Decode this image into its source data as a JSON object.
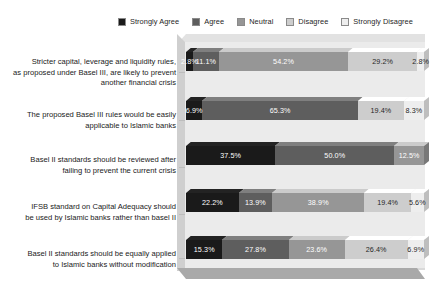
{
  "legend": {
    "position": "top-center",
    "items": [
      {
        "label": "Strongly Agree",
        "color": "#1a1a1a"
      },
      {
        "label": "Agree",
        "color": "#5e5e5e"
      },
      {
        "label": "Neutral",
        "color": "#969696"
      },
      {
        "label": "Disagree",
        "color": "#cdcdcd"
      },
      {
        "label": "Strongly Disagree",
        "color": "#eeeeee"
      }
    ]
  },
  "chart_data": {
    "type": "bar",
    "orientation": "horizontal",
    "stacked": true,
    "stack_mode": "percent",
    "title": "",
    "xlabel": "",
    "ylabel": "",
    "xlim": [
      0,
      100
    ],
    "grid": false,
    "legend_position": "top-center",
    "categories": [
      "Stricter capital, leverage and liquidity rules, as proposed under Basel III, are likely to prevent another financial crisis",
      "The proposed Basel III rules would be easily applicable to Islamic banks",
      "Basel II standards should be reviewed after failing to prevent the current crisis",
      "IFSB standard on Capital Adequacy should be used by Islamic banks rather than basel II",
      "Basel II standards should be equally applied to Islamic banks without modification"
    ],
    "series": [
      {
        "name": "Strongly Agree",
        "color": "#1a1a1a",
        "values": [
          2.8,
          6.9,
          37.5,
          22.2,
          15.3
        ]
      },
      {
        "name": "Agree",
        "color": "#5e5e5e",
        "values": [
          11.1,
          65.3,
          50.0,
          13.9,
          27.8
        ]
      },
      {
        "name": "Neutral",
        "color": "#969696",
        "values": [
          54.2,
          0,
          12.5,
          38.9,
          23.6
        ]
      },
      {
        "name": "Disagree",
        "color": "#cdcdcd",
        "values": [
          29.2,
          19.4,
          0,
          19.4,
          26.4
        ]
      },
      {
        "name": "Strongly Disagree",
        "color": "#eeeeee",
        "values": [
          2.8,
          8.3,
          0,
          5.6,
          6.9
        ]
      }
    ],
    "rows": [
      {
        "label": "Stricter capital, leverage and liquidity rules, as proposed under Basel III, are likely to prevent another financial crisis",
        "label_lines": [
          "Stricter capital, leverage and liquidity rules,",
          "as proposed under Basel III, are likely to prevent",
          "another financial crisis"
        ],
        "segments": [
          {
            "series": "Strongly Agree",
            "value": 2.8,
            "display": "2.8%",
            "color": "#1a1a1a",
            "text_color": "#ffffff"
          },
          {
            "series": "Agree",
            "value": 11.1,
            "display": "11.1%",
            "color": "#5e5e5e",
            "text_color": "#ffffff"
          },
          {
            "series": "Neutral",
            "value": 54.2,
            "display": "54.2%",
            "color": "#969696",
            "text_color": "#ffffff"
          },
          {
            "series": "Disagree",
            "value": 29.2,
            "display": "29.2%",
            "color": "#cdcdcd",
            "text_color": "#262626"
          },
          {
            "series": "Strongly Disagree",
            "value": 2.8,
            "display": "2.8%",
            "color": "#eeeeee",
            "text_color": "#262626"
          }
        ]
      },
      {
        "label": "The proposed Basel III rules would be easily applicable to Islamic banks",
        "label_lines": [
          "The proposed Basel III rules would be easily",
          "applicable to Islamic banks"
        ],
        "segments": [
          {
            "series": "Strongly Agree",
            "value": 6.9,
            "display": "6.9%",
            "color": "#1a1a1a",
            "text_color": "#ffffff"
          },
          {
            "series": "Agree",
            "value": 65.3,
            "display": "65.3%",
            "color": "#5e5e5e",
            "text_color": "#ffffff"
          },
          {
            "series": "Disagree",
            "value": 19.4,
            "display": "19.4%",
            "color": "#cdcdcd",
            "text_color": "#262626"
          },
          {
            "series": "Strongly Disagree",
            "value": 8.3,
            "display": "8.3%",
            "color": "#eeeeee",
            "text_color": "#262626"
          }
        ]
      },
      {
        "label": "Basel II standards should be reviewed after failing to prevent the current crisis",
        "label_lines": [
          "Basel II standards should be reviewed after",
          "failing to prevent the current crisis"
        ],
        "segments": [
          {
            "series": "Strongly Agree",
            "value": 37.5,
            "display": "37.5%",
            "color": "#1a1a1a",
            "text_color": "#ffffff"
          },
          {
            "series": "Agree",
            "value": 50.0,
            "display": "50.0%",
            "color": "#5e5e5e",
            "text_color": "#ffffff"
          },
          {
            "series": "Neutral",
            "value": 12.5,
            "display": "12.5%",
            "color": "#969696",
            "text_color": "#ffffff"
          }
        ]
      },
      {
        "label": "IFSB standard on Capital Adequacy should be used by Islamic banks rather than basel II",
        "label_lines": [
          "IFSB standard on Capital Adequacy should",
          "be used by Islamic banks rather than basel II"
        ],
        "segments": [
          {
            "series": "Strongly Agree",
            "value": 22.2,
            "display": "22.2%",
            "color": "#1a1a1a",
            "text_color": "#ffffff"
          },
          {
            "series": "Agree",
            "value": 13.9,
            "display": "13.9%",
            "color": "#5e5e5e",
            "text_color": "#ffffff"
          },
          {
            "series": "Neutral",
            "value": 38.9,
            "display": "38.9%",
            "color": "#969696",
            "text_color": "#ffffff"
          },
          {
            "series": "Disagree",
            "value": 19.4,
            "display": "19.4%",
            "color": "#cdcdcd",
            "text_color": "#262626"
          },
          {
            "series": "Strongly Disagree",
            "value": 5.6,
            "display": "5.6%",
            "color": "#eeeeee",
            "text_color": "#262626"
          }
        ]
      },
      {
        "label": "Basel II standards should be equally applied to Islamic banks without modification",
        "label_lines": [
          "Basel II standards should be equally applied",
          "to Islamic banks without modification"
        ],
        "segments": [
          {
            "series": "Strongly Agree",
            "value": 15.3,
            "display": "15.3%",
            "color": "#1a1a1a",
            "text_color": "#ffffff"
          },
          {
            "series": "Agree",
            "value": 27.8,
            "display": "27.8%",
            "color": "#5e5e5e",
            "text_color": "#ffffff"
          },
          {
            "series": "Neutral",
            "value": 23.6,
            "display": "23.6%",
            "color": "#969696",
            "text_color": "#ffffff"
          },
          {
            "series": "Disagree",
            "value": 26.4,
            "display": "26.4%",
            "color": "#cdcdcd",
            "text_color": "#262626"
          },
          {
            "series": "Strongly Disagree",
            "value": 6.9,
            "display": "6.9%",
            "color": "#eeeeee",
            "text_color": "#262626"
          }
        ]
      }
    ]
  },
  "style": {
    "plot_background": "#ebebeb",
    "plot_top_face": "#e2e2e2",
    "plot_left_face": "#cfcfcf",
    "floor_color": "#a9a9a9",
    "page_background": "#ffffff"
  }
}
